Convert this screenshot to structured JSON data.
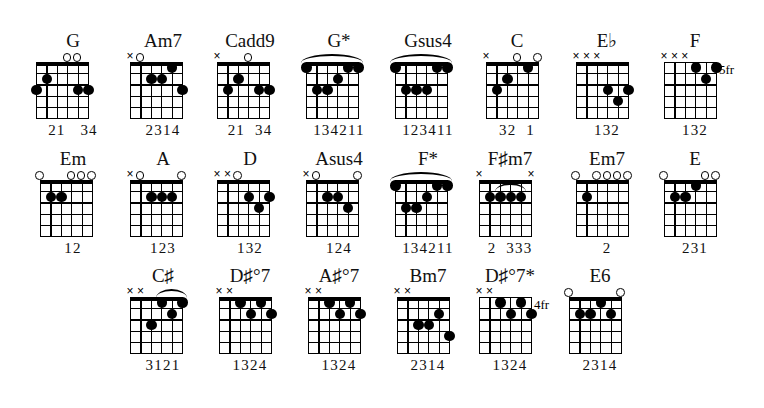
{
  "page": {
    "background_color": "#ffffff",
    "ink_color": "#000000",
    "strings": 6,
    "frets": 5,
    "marker_open": "open-string-circle",
    "marker_muted": "muted-string-x"
  },
  "rows": [
    {
      "row_index": 0,
      "top": 30,
      "chords": [
        {
          "name": "G",
          "left": 28,
          "grid_left": 8,
          "grid_width": 52,
          "markers": [
            {
              "string": 3,
              "type": "o"
            },
            {
              "string": 2,
              "type": "o"
            }
          ],
          "dots": [
            {
              "string": 5,
              "fret": 2
            },
            {
              "string": 6,
              "fret": 3
            },
            {
              "string": 2,
              "fret": 3
            },
            {
              "string": 1,
              "fret": 3
            }
          ],
          "barre": null,
          "fret_label": "",
          "fingering": "21   34"
        },
        {
          "name": "Am7",
          "left": 118,
          "grid_left": 12,
          "grid_width": 52,
          "markers": [
            {
              "string": 6,
              "type": "x"
            },
            {
              "string": 5,
              "type": "o"
            }
          ],
          "dots": [
            {
              "string": 4,
              "fret": 2
            },
            {
              "string": 3,
              "fret": 2
            },
            {
              "string": 2,
              "fret": 1
            },
            {
              "string": 1,
              "fret": 3
            }
          ],
          "barre": null,
          "fret_label": "",
          "fingering": "2314"
        },
        {
          "name": "Cadd9",
          "left": 205,
          "grid_left": 12,
          "grid_width": 52,
          "markers": [
            {
              "string": 6,
              "type": "x"
            },
            {
              "string": 3,
              "type": "o"
            }
          ],
          "dots": [
            {
              "string": 5,
              "fret": 3
            },
            {
              "string": 4,
              "fret": 2
            },
            {
              "string": 2,
              "fret": 3
            },
            {
              "string": 1,
              "fret": 3
            }
          ],
          "barre": null,
          "fret_label": "",
          "fingering": "21  34"
        },
        {
          "name": "G*",
          "left": 294,
          "grid_left": 12,
          "grid_width": 52,
          "markers": [],
          "dots": [
            {
              "string": 6,
              "fret": 1
            },
            {
              "string": 5,
              "fret": 3
            },
            {
              "string": 4,
              "fret": 3
            },
            {
              "string": 3,
              "fret": 2
            },
            {
              "string": 2,
              "fret": 1
            },
            {
              "string": 1,
              "fret": 1
            }
          ],
          "barre": {
            "from_string": 6,
            "to_string": 1,
            "fret": 1
          },
          "fret_label": "",
          "fingering": "134211"
        },
        {
          "name": "Gsus4",
          "left": 383,
          "grid_left": 12,
          "grid_width": 52,
          "markers": [],
          "dots": [
            {
              "string": 6,
              "fret": 1
            },
            {
              "string": 5,
              "fret": 3
            },
            {
              "string": 4,
              "fret": 3
            },
            {
              "string": 3,
              "fret": 3
            },
            {
              "string": 2,
              "fret": 1
            },
            {
              "string": 1,
              "fret": 1
            }
          ],
          "barre": {
            "from_string": 6,
            "to_string": 1,
            "fret": 1
          },
          "fret_label": "",
          "fingering": "123411"
        },
        {
          "name": "C",
          "left": 472,
          "grid_left": 14,
          "grid_width": 52,
          "markers": [
            {
              "string": 6,
              "type": "x"
            },
            {
              "string": 3,
              "type": "o"
            },
            {
              "string": 1,
              "type": "o"
            }
          ],
          "dots": [
            {
              "string": 5,
              "fret": 3
            },
            {
              "string": 4,
              "fret": 2
            },
            {
              "string": 2,
              "fret": 1
            }
          ],
          "barre": null,
          "fret_label": "",
          "fingering": "32  1"
        },
        {
          "name": "E♭",
          "left": 562,
          "grid_left": 14,
          "grid_width": 52,
          "markers": [
            {
              "string": 6,
              "type": "x"
            },
            {
              "string": 5,
              "type": "x"
            },
            {
              "string": 4,
              "type": "x"
            }
          ],
          "dots": [
            {
              "string": 3,
              "fret": 3
            },
            {
              "string": 2,
              "fret": 4
            },
            {
              "string": 1,
              "fret": 3
            }
          ],
          "barre": null,
          "fret_label": "",
          "fingering": "132"
        },
        {
          "name": "F",
          "left": 650,
          "grid_left": 14,
          "grid_width": 52,
          "markers": [
            {
              "string": 6,
              "type": "x"
            },
            {
              "string": 5,
              "type": "x"
            },
            {
              "string": 4,
              "type": "x"
            }
          ],
          "dots": [
            {
              "string": 3,
              "fret": 1
            },
            {
              "string": 2,
              "fret": 2
            },
            {
              "string": 1,
              "fret": 1
            }
          ],
          "barre": null,
          "fret_label": "5fr",
          "fingering": "132"
        }
      ]
    },
    {
      "row_index": 1,
      "top": 148,
      "chords": [
        {
          "name": "Em",
          "left": 28,
          "grid_left": 12,
          "grid_width": 52,
          "markers": [
            {
              "string": 6,
              "type": "o"
            },
            {
              "string": 3,
              "type": "o"
            },
            {
              "string": 2,
              "type": "o"
            },
            {
              "string": 1,
              "type": "o"
            }
          ],
          "dots": [
            {
              "string": 5,
              "fret": 2
            },
            {
              "string": 4,
              "fret": 2
            }
          ],
          "barre": null,
          "fret_label": "",
          "fingering": "12"
        },
        {
          "name": "A",
          "left": 118,
          "grid_left": 12,
          "grid_width": 52,
          "markers": [
            {
              "string": 6,
              "type": "x"
            },
            {
              "string": 5,
              "type": "o"
            },
            {
              "string": 1,
              "type": "o"
            }
          ],
          "dots": [
            {
              "string": 4,
              "fret": 2
            },
            {
              "string": 3,
              "fret": 2
            },
            {
              "string": 2,
              "fret": 2
            }
          ],
          "barre": null,
          "fret_label": "",
          "fingering": "123"
        },
        {
          "name": "D",
          "left": 205,
          "grid_left": 12,
          "grid_width": 52,
          "markers": [
            {
              "string": 6,
              "type": "x"
            },
            {
              "string": 5,
              "type": "x"
            },
            {
              "string": 4,
              "type": "o"
            }
          ],
          "dots": [
            {
              "string": 3,
              "fret": 2
            },
            {
              "string": 2,
              "fret": 3
            },
            {
              "string": 1,
              "fret": 2
            }
          ],
          "barre": null,
          "fret_label": "",
          "fingering": "132"
        },
        {
          "name": "Asus4",
          "left": 294,
          "grid_left": 12,
          "grid_width": 52,
          "markers": [
            {
              "string": 6,
              "type": "x"
            },
            {
              "string": 5,
              "type": "o"
            },
            {
              "string": 1,
              "type": "o"
            }
          ],
          "dots": [
            {
              "string": 4,
              "fret": 2
            },
            {
              "string": 3,
              "fret": 2
            },
            {
              "string": 2,
              "fret": 3
            }
          ],
          "barre": null,
          "fret_label": "",
          "fingering": "124"
        },
        {
          "name": "F*",
          "left": 383,
          "grid_left": 12,
          "grid_width": 52,
          "markers": [],
          "dots": [
            {
              "string": 6,
              "fret": 1
            },
            {
              "string": 5,
              "fret": 3
            },
            {
              "string": 4,
              "fret": 3
            },
            {
              "string": 3,
              "fret": 2
            },
            {
              "string": 2,
              "fret": 1
            },
            {
              "string": 1,
              "fret": 1
            }
          ],
          "barre": {
            "from_string": 6,
            "to_string": 1,
            "fret": 1
          },
          "fret_label": "",
          "fingering": "134211"
        },
        {
          "name": "F♯m7",
          "left": 465,
          "grid_left": 14,
          "grid_width": 52,
          "markers": [
            {
              "string": 6,
              "type": "x"
            },
            {
              "string": 1,
              "type": "x"
            }
          ],
          "dots": [
            {
              "string": 5,
              "fret": 2
            },
            {
              "string": 4,
              "fret": 2
            },
            {
              "string": 3,
              "fret": 2
            },
            {
              "string": 2,
              "fret": 2
            }
          ],
          "barre": {
            "from_string": 4,
            "to_string": 2,
            "fret": 2
          },
          "fret_label": "",
          "fingering": "2  333"
        },
        {
          "name": "Em7",
          "left": 562,
          "grid_left": 14,
          "grid_width": 52,
          "markers": [
            {
              "string": 6,
              "type": "o"
            },
            {
              "string": 4,
              "type": "o"
            },
            {
              "string": 3,
              "type": "o"
            },
            {
              "string": 2,
              "type": "o"
            },
            {
              "string": 1,
              "type": "o"
            }
          ],
          "dots": [
            {
              "string": 5,
              "fret": 2
            }
          ],
          "barre": null,
          "fret_label": "",
          "fingering": "2"
        },
        {
          "name": "E",
          "left": 650,
          "grid_left": 14,
          "grid_width": 52,
          "markers": [
            {
              "string": 6,
              "type": "o"
            },
            {
              "string": 2,
              "type": "o"
            },
            {
              "string": 1,
              "type": "o"
            }
          ],
          "dots": [
            {
              "string": 5,
              "fret": 2
            },
            {
              "string": 4,
              "fret": 2
            },
            {
              "string": 3,
              "fret": 1
            }
          ],
          "barre": null,
          "fret_label": "",
          "fingering": "231"
        }
      ]
    },
    {
      "row_index": 2,
      "top": 265,
      "chords": [
        {
          "name": "C♯",
          "left": 118,
          "grid_left": 12,
          "grid_width": 52,
          "markers": [
            {
              "string": 6,
              "type": "x"
            },
            {
              "string": 5,
              "type": "x"
            }
          ],
          "dots": [
            {
              "string": 4,
              "fret": 3
            },
            {
              "string": 3,
              "fret": 1
            },
            {
              "string": 2,
              "fret": 2
            },
            {
              "string": 1,
              "fret": 1
            }
          ],
          "barre": {
            "from_string": 3,
            "to_string": 1,
            "fret": 1
          },
          "fret_label": "",
          "fingering": "3121"
        },
        {
          "name": "D♯°7",
          "left": 205,
          "grid_left": 14,
          "grid_width": 52,
          "markers": [
            {
              "string": 6,
              "type": "x"
            },
            {
              "string": 5,
              "type": "x"
            }
          ],
          "dots": [
            {
              "string": 4,
              "fret": 1
            },
            {
              "string": 3,
              "fret": 2
            },
            {
              "string": 2,
              "fret": 1
            },
            {
              "string": 1,
              "fret": 2
            }
          ],
          "barre": null,
          "fret_label": "",
          "fingering": "1324"
        },
        {
          "name": "A♯°7",
          "left": 294,
          "grid_left": 14,
          "grid_width": 52,
          "markers": [
            {
              "string": 6,
              "type": "x"
            },
            {
              "string": 5,
              "type": "x"
            }
          ],
          "dots": [
            {
              "string": 4,
              "fret": 1
            },
            {
              "string": 3,
              "fret": 2
            },
            {
              "string": 2,
              "fret": 1
            },
            {
              "string": 1,
              "fret": 2
            }
          ],
          "barre": null,
          "fret_label": "",
          "fingering": "1324"
        },
        {
          "name": "Bm7",
          "left": 383,
          "grid_left": 14,
          "grid_width": 52,
          "markers": [
            {
              "string": 6,
              "type": "x"
            },
            {
              "string": 5,
              "type": "x"
            }
          ],
          "dots": [
            {
              "string": 4,
              "fret": 3
            },
            {
              "string": 3,
              "fret": 3
            },
            {
              "string": 2,
              "fret": 2
            },
            {
              "string": 1,
              "fret": 4
            }
          ],
          "barre": null,
          "fret_label": "",
          "fingering": "2314"
        },
        {
          "name": "D♯°7*",
          "left": 465,
          "grid_left": 14,
          "grid_width": 52,
          "markers": [
            {
              "string": 6,
              "type": "x"
            },
            {
              "string": 5,
              "type": "x"
            }
          ],
          "dots": [
            {
              "string": 4,
              "fret": 1
            },
            {
              "string": 3,
              "fret": 2
            },
            {
              "string": 2,
              "fret": 1
            },
            {
              "string": 1,
              "fret": 2
            }
          ],
          "barre": null,
          "fret_label": "4fr",
          "fingering": "1324"
        },
        {
          "name": "E6",
          "left": 555,
          "grid_left": 14,
          "grid_width": 52,
          "markers": [
            {
              "string": 6,
              "type": "o"
            },
            {
              "string": 1,
              "type": "o"
            }
          ],
          "dots": [
            {
              "string": 5,
              "fret": 2
            },
            {
              "string": 4,
              "fret": 2
            },
            {
              "string": 3,
              "fret": 1
            },
            {
              "string": 2,
              "fret": 2
            }
          ],
          "barre": null,
          "fret_label": "",
          "fingering": "2314"
        }
      ]
    }
  ]
}
